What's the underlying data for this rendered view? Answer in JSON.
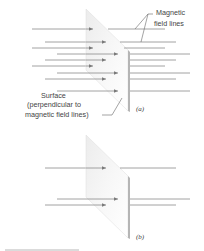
{
  "figure": {
    "panel_a": {
      "label": "(a)",
      "callout_field_lines": [
        "Magnetic",
        "field lines"
      ],
      "callout_surface": [
        "Surface",
        "(perpendicular to",
        "magnetic field lines)"
      ],
      "field_line_count": 10
    },
    "panel_b": {
      "label": "(b)",
      "field_line_count": 3
    },
    "colors": {
      "field_line": "#8a8a8a",
      "arrowhead": "#7a7a7a",
      "plate_face": "#f2f2f2",
      "plate_edge": "#b5b5b5",
      "text": "#444444"
    }
  }
}
